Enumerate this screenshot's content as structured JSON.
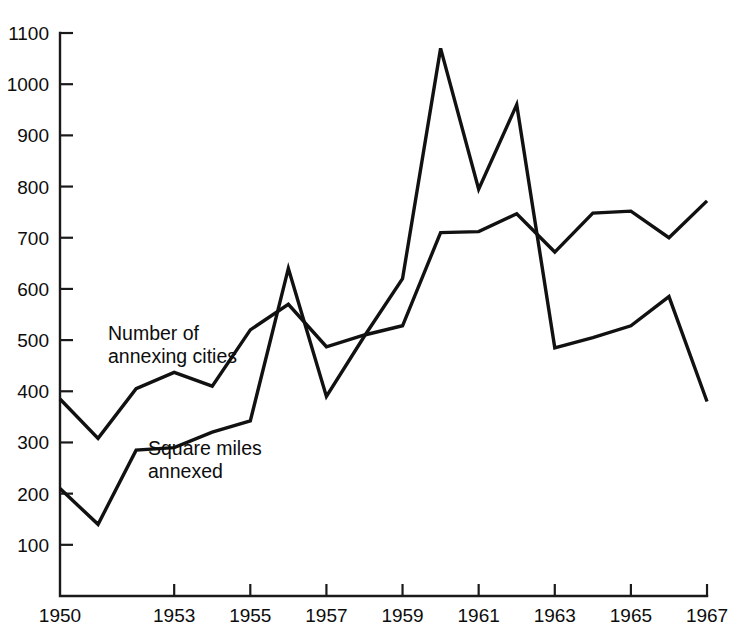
{
  "chart_data": {
    "type": "line",
    "title": "",
    "subtitle": "",
    "xlabel": "",
    "ylabel": "",
    "xlim": [
      1950,
      1967
    ],
    "ylim": [
      0,
      1100
    ],
    "grid": false,
    "legend_position": "inline-annotation",
    "x": [
      1950,
      1951,
      1952,
      1953,
      1954,
      1955,
      1956,
      1957,
      1958,
      1959,
      1960,
      1961,
      1962,
      1963,
      1964,
      1965,
      1966,
      1967
    ],
    "y_ticks": [
      100,
      200,
      300,
      400,
      500,
      600,
      700,
      800,
      900,
      1000,
      1100
    ],
    "y_tick_labels": [
      "100",
      "200",
      "300",
      "400",
      "500",
      "600",
      "700",
      "800",
      "900",
      "1000",
      "1100"
    ],
    "x_ticks": [
      1950,
      1953,
      1955,
      1957,
      1959,
      1961,
      1963,
      1965,
      1967
    ],
    "x_tick_labels": [
      "1950",
      "1953",
      "1955",
      "1957",
      "1959",
      "1961",
      "1963",
      "1965",
      "1967"
    ],
    "series": [
      {
        "name": "Number of annexing cities",
        "label": "Number of\nannexing cities",
        "label_line1": "Number of",
        "label_line2": "annexing cities",
        "color": "#111111",
        "values": [
          385,
          308,
          405,
          437,
          410,
          520,
          570,
          487,
          510,
          528,
          710,
          712,
          747,
          672,
          748,
          752,
          700,
          772
        ]
      },
      {
        "name": "Square miles annexed",
        "label": "Square miles\nannexed",
        "label_line1": "Square miles",
        "label_line2": "annexed",
        "color": "#111111",
        "values": [
          210,
          140,
          285,
          290,
          320,
          342,
          640,
          390,
          508,
          620,
          1070,
          795,
          960,
          485,
          505,
          528,
          585,
          380
        ]
      }
    ],
    "annotations": [
      {
        "name": "annexing-cities-label",
        "line1": "Number of",
        "line2": "annexing cities",
        "x_px": 108,
        "y_px": 340
      },
      {
        "name": "square-miles-label",
        "line1": "Square miles",
        "line2": "annexed",
        "x_px": 148,
        "y_px": 455
      }
    ],
    "axis_geometry": {
      "x_origin_px": 60,
      "x_end_px": 707,
      "y_zero_px": 596,
      "y_top_px": 33,
      "px_per_year": 38.06,
      "px_per_unit": 0.5118
    }
  }
}
